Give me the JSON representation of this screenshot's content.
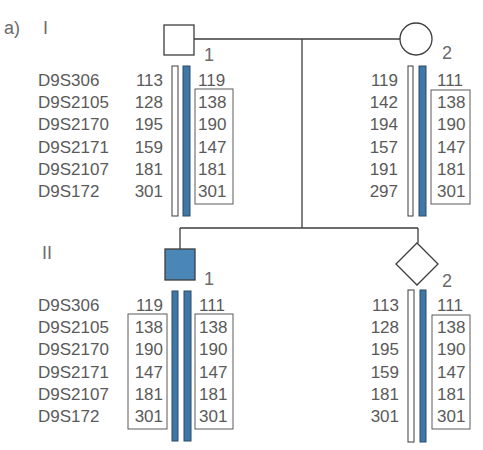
{
  "panel_label": "a)",
  "generations": [
    {
      "label": "I"
    },
    {
      "label": "II"
    }
  ],
  "markers": [
    "D9S306",
    "D9S2105",
    "D9S2170",
    "D9S2171",
    "D9S2107",
    "D9S172"
  ],
  "colors": {
    "affected_fill": "#4a86b6",
    "disease_haplotype_bar": "#3e78a8",
    "normal_haplotype_bar": "#ffffff",
    "text": "#5a5a5a",
    "line": "#3c3c3c"
  },
  "individuals": [
    {
      "id": "I-1",
      "generation": "I",
      "number": "1",
      "sex": "male",
      "affected": false,
      "show_marker_labels": true,
      "left_haplotype": {
        "bar": "normal",
        "alleles": [
          "113",
          "128",
          "195",
          "159",
          "181",
          "301"
        ],
        "boxed": false
      },
      "right_haplotype": {
        "bar": "disease",
        "alleles": [
          "119",
          "138",
          "190",
          "147",
          "181",
          "301"
        ],
        "boxed": true,
        "boxed_markers": [
          "D9S2105",
          "D9S2170",
          "D9S2171",
          "D9S2107",
          "D9S172"
        ]
      }
    },
    {
      "id": "I-2",
      "generation": "I",
      "number": "2",
      "sex": "female",
      "affected": false,
      "show_marker_labels": false,
      "left_haplotype": {
        "bar": "normal",
        "alleles": [
          "119",
          "142",
          "194",
          "157",
          "191",
          "297"
        ],
        "boxed": false
      },
      "right_haplotype": {
        "bar": "disease",
        "alleles": [
          "111",
          "138",
          "190",
          "147",
          "181",
          "301"
        ],
        "boxed": true,
        "boxed_markers": [
          "D9S2105",
          "D9S2170",
          "D9S2171",
          "D9S2107",
          "D9S172"
        ]
      }
    },
    {
      "id": "II-1",
      "generation": "II",
      "number": "1",
      "sex": "male",
      "affected": true,
      "show_marker_labels": true,
      "left_haplotype": {
        "bar": "disease",
        "alleles": [
          "119",
          "138",
          "190",
          "147",
          "181",
          "301"
        ],
        "boxed": true,
        "boxed_markers": [
          "D9S2105",
          "D9S2170",
          "D9S2171",
          "D9S2107",
          "D9S172"
        ]
      },
      "right_haplotype": {
        "bar": "disease",
        "alleles": [
          "111",
          "138",
          "190",
          "147",
          "181",
          "301"
        ],
        "boxed": true,
        "boxed_markers": [
          "D9S2105",
          "D9S2170",
          "D9S2171",
          "D9S2107",
          "D9S172"
        ]
      }
    },
    {
      "id": "II-2",
      "generation": "II",
      "number": "2",
      "sex": "unknown",
      "affected": false,
      "show_marker_labels": false,
      "left_haplotype": {
        "bar": "normal",
        "alleles": [
          "113",
          "128",
          "195",
          "159",
          "181",
          "301"
        ],
        "boxed": false
      },
      "right_haplotype": {
        "bar": "disease",
        "alleles": [
          "111",
          "138",
          "190",
          "147",
          "181",
          "301"
        ],
        "boxed": true,
        "boxed_markers": [
          "D9S2105",
          "D9S2170",
          "D9S2171",
          "D9S2107",
          "D9S172"
        ]
      }
    }
  ]
}
